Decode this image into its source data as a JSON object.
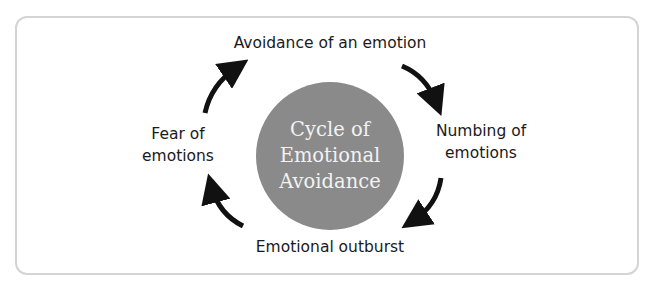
{
  "diagram": {
    "type": "cycle",
    "center": {
      "lines": [
        "Cycle of",
        "Emotional",
        "Avoidance"
      ],
      "color": "#8a8a8a",
      "text_color": "#f2f2f2"
    },
    "nodes": [
      {
        "id": "top",
        "lines": [
          "Avoidance of an emotion"
        ]
      },
      {
        "id": "right",
        "lines": [
          "Numbing of",
          "emotions"
        ]
      },
      {
        "id": "bottom",
        "lines": [
          "Emotional outburst"
        ]
      },
      {
        "id": "left",
        "lines": [
          "Fear of",
          "emotions"
        ]
      }
    ],
    "arrows": [
      {
        "from": "top",
        "to": "right",
        "direction": "clockwise"
      },
      {
        "from": "right",
        "to": "bottom",
        "direction": "clockwise"
      },
      {
        "from": "bottom",
        "to": "left",
        "direction": "clockwise"
      },
      {
        "from": "left",
        "to": "top",
        "direction": "clockwise"
      }
    ],
    "border_color": "#d4d4d4",
    "arrow_color": "#111111"
  }
}
